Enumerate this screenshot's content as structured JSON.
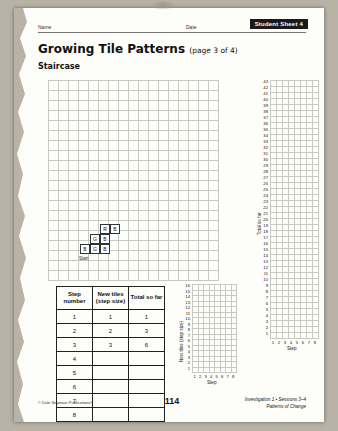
{
  "header": {
    "name_label": "Name",
    "date_label": "Date",
    "sheet_tab": "Student Sheet 4"
  },
  "title": {
    "main": "Growing Tile Patterns",
    "page_of": "(page 3 of 4)",
    "section": "Staircase"
  },
  "staircase": {
    "start_label": "Start",
    "tiles": [
      {
        "label": "R"
      },
      {
        "label": "B"
      },
      {
        "label": "G"
      },
      {
        "label": "B"
      },
      {
        "label": "B"
      },
      {
        "label": "G"
      },
      {
        "label": "B"
      }
    ]
  },
  "table": {
    "headers": [
      "Step number",
      "New tiles (step size)",
      "Total so far"
    ],
    "rows": [
      [
        "1",
        "1",
        "1"
      ],
      [
        "2",
        "2",
        "3"
      ],
      [
        "3",
        "3",
        "6"
      ],
      [
        "4",
        "",
        ""
      ],
      [
        "5",
        "",
        ""
      ],
      [
        "6",
        "",
        ""
      ],
      [
        "7",
        "",
        ""
      ],
      [
        "8",
        "",
        ""
      ]
    ]
  },
  "chart_data": [
    {
      "type": "scatter",
      "title": "",
      "xlabel": "Step",
      "ylabel": "New tiles (step size)",
      "x": [
        1,
        2,
        3,
        4,
        5,
        6,
        7,
        8
      ],
      "xticklabels": [
        "1",
        "2",
        "3",
        "4",
        "5",
        "6",
        "7",
        "8"
      ],
      "yticklabels": [
        "1",
        "2",
        "3",
        "4",
        "5",
        "6",
        "7",
        "8",
        "9",
        "10",
        "11",
        "12",
        "13",
        "14",
        "15",
        "16"
      ],
      "ylim": [
        0,
        16
      ],
      "xlim": [
        0,
        8
      ],
      "values": [],
      "grid": true
    },
    {
      "type": "scatter",
      "title": "",
      "xlabel": "Step",
      "ylabel": "Total so far",
      "x": [
        1,
        2,
        3,
        4,
        5,
        6,
        7,
        8
      ],
      "xticklabels": [
        "1",
        "2",
        "3",
        "4",
        "5",
        "6",
        "7",
        "8"
      ],
      "yticklabels": [
        "1",
        "2",
        "3",
        "4",
        "5",
        "6",
        "7",
        "8",
        "9",
        "10",
        "11",
        "12",
        "13",
        "14",
        "15",
        "16",
        "17",
        "18",
        "19",
        "20",
        "21",
        "22",
        "23",
        "24",
        "25",
        "26",
        "27",
        "28",
        "29",
        "30",
        "31",
        "32",
        "33",
        "34",
        "35",
        "36",
        "37",
        "38",
        "39",
        "40",
        "41",
        "42",
        "43"
      ],
      "ylim": [
        0,
        43
      ],
      "xlim": [
        0,
        8
      ],
      "values": [],
      "grid": true
    }
  ],
  "footer": {
    "copyright": "© Dale Seymour Publications®",
    "page_number": "114",
    "line1": "Investigation 1 • Sessions 3–4",
    "line2": "Patterns of Change"
  }
}
